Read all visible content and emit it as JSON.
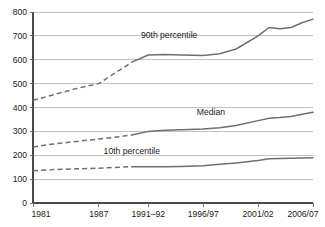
{
  "chart_data": {
    "type": "line",
    "title": "",
    "subtitle": "",
    "xlabel": "",
    "ylabel": "",
    "ylim": [
      0,
      800
    ],
    "yticks": [
      0,
      100,
      200,
      300,
      400,
      500,
      600,
      700,
      800
    ],
    "ytick_labels": [
      "0",
      "100",
      "200",
      "300",
      "400",
      "500",
      "600",
      "700",
      "800"
    ],
    "grid": true,
    "legend_position": "inline-annotations",
    "x_tick_labels": [
      "1981",
      "1987",
      "1991–92",
      "1996/97",
      "2001/02",
      "2006/07"
    ],
    "x_tick_positions": [
      1981,
      1987,
      1991.5,
      1996.5,
      2001.5,
      2006.5
    ],
    "xlim": [
      1981,
      2006.5
    ],
    "line_color": "#6e6e6e",
    "gridline_color": "#a8a8a8",
    "axis_color": "#4a4a4a",
    "background_color": "#ffffff",
    "dashed_note": "Segments before 1990 are drawn dashed (interpolated); later segments are solid.",
    "series": [
      {
        "name": "90th percentile",
        "annotation": "90th percentile",
        "annotation_x": 1993.4,
        "annotation_y": 690,
        "dash_until": 1990,
        "x": [
          1981,
          1983,
          1985,
          1987,
          1989,
          1990,
          1991.5,
          1993,
          1994.5,
          1996.5,
          1998,
          1999.5,
          2001.5,
          2002.5,
          2003.5,
          2004.5,
          2005.5,
          2006.5
        ],
        "values": [
          430,
          455,
          480,
          500,
          560,
          590,
          620,
          622,
          620,
          618,
          625,
          645,
          700,
          735,
          730,
          735,
          755,
          770
        ]
      },
      {
        "name": "Median",
        "annotation": "Median",
        "annotation_x": 1997.2,
        "annotation_y": 368,
        "dash_until": 1990,
        "x": [
          1981,
          1983,
          1985,
          1987,
          1989,
          1990,
          1991.5,
          1993,
          1994.5,
          1996.5,
          1998,
          1999.5,
          2001.5,
          2002.5,
          2003.5,
          2004.5,
          2005.5,
          2006.5
        ],
        "values": [
          235,
          248,
          258,
          268,
          278,
          285,
          300,
          305,
          307,
          310,
          315,
          325,
          345,
          355,
          358,
          362,
          372,
          380
        ]
      },
      {
        "name": "10th percentile",
        "annotation": "10th percentile",
        "annotation_x": 1990.0,
        "annotation_y": 205,
        "dash_until": 1990,
        "x": [
          1981,
          1983,
          1985,
          1987,
          1989,
          1990,
          1991.5,
          1993,
          1994.5,
          1996.5,
          1998,
          1999.5,
          2001.5,
          2002.5,
          2003.5,
          2004.5,
          2005.5,
          2006.5
        ],
        "values": [
          135,
          140,
          143,
          146,
          150,
          152,
          152,
          152,
          153,
          156,
          162,
          168,
          178,
          185,
          186,
          187,
          189,
          190
        ]
      }
    ]
  }
}
